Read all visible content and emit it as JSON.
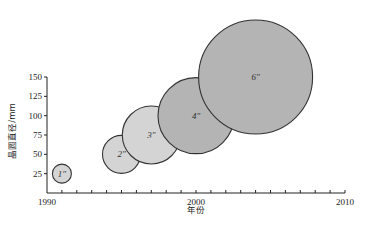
{
  "chart_data": {
    "type": "scatter",
    "subtype": "bubble",
    "title": "",
    "xlabel": "年份",
    "ylabel": "晶圆直径/mm",
    "xlim": [
      1990,
      2010
    ],
    "ylim": [
      0,
      150
    ],
    "x_ticks": [
      1990,
      2000,
      2010
    ],
    "x_minor_tick_step": 1,
    "y_ticks": [
      25,
      50,
      75,
      100,
      125,
      150
    ],
    "grid": false,
    "legend": null,
    "series": [
      {
        "name": "wafer sizes",
        "points": [
          {
            "label": "1″",
            "year": 1991,
            "diameter_mm": 25,
            "bubble_radius_px": 9.5,
            "color": "#d4d4d4"
          },
          {
            "label": "2″",
            "year": 1995,
            "diameter_mm": 50,
            "bubble_radius_px": 19,
            "color": "#d4d4d4"
          },
          {
            "label": "3″",
            "year": 1997,
            "diameter_mm": 75,
            "bubble_radius_px": 29,
            "color": "#d4d4d4"
          },
          {
            "label": "4″",
            "year": 2000,
            "diameter_mm": 100,
            "bubble_radius_px": 38,
            "color": "#b4b4b4"
          },
          {
            "label": "6″",
            "year": 2004,
            "diameter_mm": 150,
            "bubble_radius_px": 57,
            "color": "#b4b4b4"
          }
        ]
      }
    ]
  }
}
